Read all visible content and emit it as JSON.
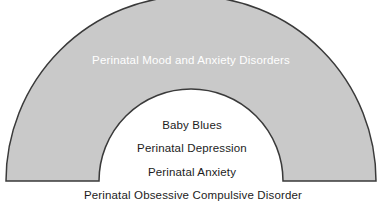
{
  "diagram": {
    "type": "nested-semicircular-arch",
    "colors": {
      "band_fill": "#c9c9c9",
      "band_stroke": "#3a3a3a",
      "inner_fill": "#ffffff",
      "band_text": "#ffffff",
      "inner_text": "#1c1c1c",
      "background": "#ffffff"
    },
    "geometry": {
      "center_x": 191,
      "center_y": 181,
      "outer_radius": 185,
      "inner_radius": 92,
      "stroke_width": 1.5
    },
    "outer_band": {
      "label": "Perinatal Mood and Anxiety Disorders"
    },
    "inner_items": [
      {
        "label": "Baby Blues"
      },
      {
        "label": "Perinatal Depression"
      },
      {
        "label": "Perinatal Anxiety"
      }
    ],
    "bottom_caption": {
      "label": "Perinatal Obsessive Compulsive Disorder"
    }
  }
}
